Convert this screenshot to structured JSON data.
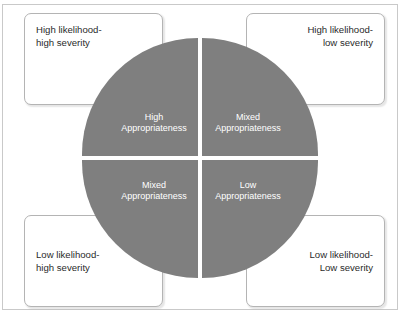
{
  "figure": {
    "type": "quadrant-matrix-diagram",
    "circle_fill_color": "#7f7f7f",
    "box_border_color": "#b4b4b4",
    "quadrant_text_color": "#ffffff",
    "label_text_color": "#2b2b2b"
  },
  "corner_labels": {
    "top_left": "High likelihood-\nhigh severity",
    "top_right": "High likelihood-\nlow severity",
    "bottom_left": "Low likelihood-\nhigh severity",
    "bottom_right": "Low likelihood-\nLow severity"
  },
  "quadrants": {
    "top_left": "High\nAppropriateness",
    "top_right": "Mixed\nAppropriateness",
    "bottom_left": "Mixed\nAppropriateness",
    "bottom_right": "Low\nAppropriateness"
  }
}
